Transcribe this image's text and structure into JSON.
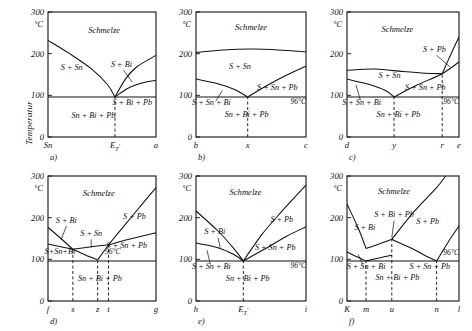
{
  "figure": {
    "y_axis_label": "Temperatur",
    "unit_label": "°C",
    "y_ticks": [
      "300",
      "200",
      "100",
      "0"
    ],
    "eutectic_label": "96°C",
    "melt_label": "Schmelze"
  },
  "chart_data": {
    "type": "line",
    "ylabel": "Temperatur",
    "yunit": "°C",
    "ylim": [
      0,
      300
    ],
    "yticks": [
      0,
      100,
      200,
      300
    ],
    "eutectic_temperature": 96,
    "grid": false,
    "panels": [
      {
        "id": "a",
        "caption": "a)",
        "axis_labels": [
          "Sn",
          "E'_T",
          "a"
        ],
        "axis_label_positions": [
          0.0,
          0.62,
          1.0
        ],
        "dashed_verticals": [
          0.62
        ],
        "regions": [
          {
            "label": "Schmelze",
            "x": 0.52,
            "y": 250
          },
          {
            "label": "S + Sn",
            "x": 0.22,
            "y": 160
          },
          {
            "label": "S + Bi",
            "x": 0.68,
            "y": 168
          },
          {
            "label": "S + Bi + Pb",
            "x": 0.78,
            "y": 78
          },
          {
            "label": "Sn + Bi + Pb",
            "x": 0.42,
            "y": 45
          }
        ],
        "curves": [
          {
            "name": "liquidus-Sn",
            "points": [
              [
                0.0,
                232
              ],
              [
                0.2,
                200
              ],
              [
                0.4,
                164
              ],
              [
                0.55,
                126
              ],
              [
                0.62,
                96
              ]
            ]
          },
          {
            "name": "liquidus-right-upper",
            "points": [
              [
                0.62,
                96
              ],
              [
                0.72,
                140
              ],
              [
                0.82,
                168
              ],
              [
                1.0,
                196
              ]
            ]
          },
          {
            "name": "liquidus-right-lower",
            "points": [
              [
                0.62,
                96
              ],
              [
                0.75,
                118
              ],
              [
                0.88,
                130
              ],
              [
                1.0,
                136
              ]
            ]
          }
        ],
        "eutectic_line_y": 96
      },
      {
        "id": "b",
        "caption": "b)",
        "axis_labels": [
          "b",
          "x",
          "c"
        ],
        "axis_label_positions": [
          0.0,
          0.47,
          1.0
        ],
        "dashed_verticals": [
          0.47
        ],
        "regions": [
          {
            "label": "Schmelze",
            "x": 0.5,
            "y": 258
          },
          {
            "label": "S + Sn",
            "x": 0.4,
            "y": 163
          },
          {
            "label": "S + Sn + Pb",
            "x": 0.74,
            "y": 112
          },
          {
            "label": "S + Sn + Bi",
            "x": 0.14,
            "y": 78
          },
          {
            "label": "Sn + Bi + Pb",
            "x": 0.46,
            "y": 48
          },
          {
            "label": "96°C",
            "x": 0.93,
            "y": 80
          }
        ],
        "curves": [
          {
            "name": "upper-liquidus",
            "points": [
              [
                0.0,
                203
              ],
              [
                0.25,
                209
              ],
              [
                0.5,
                211
              ],
              [
                0.75,
                209
              ],
              [
                1.0,
                204
              ]
            ]
          },
          {
            "name": "solidus-left",
            "points": [
              [
                0.0,
                139
              ],
              [
                0.2,
                128
              ],
              [
                0.35,
                114
              ],
              [
                0.47,
                96
              ]
            ]
          },
          {
            "name": "solidus-right",
            "points": [
              [
                0.47,
                96
              ],
              [
                0.65,
                124
              ],
              [
                0.82,
                148
              ],
              [
                1.0,
                170
              ]
            ]
          }
        ],
        "eutectic_line_y": 96
      },
      {
        "id": "c",
        "caption": "c)",
        "axis_labels": [
          "d",
          "y",
          "r",
          "e"
        ],
        "axis_label_positions": [
          0.0,
          0.42,
          0.85,
          1.0
        ],
        "dashed_verticals": [
          0.42,
          0.85
        ],
        "regions": [
          {
            "label": "Schmelze",
            "x": 0.45,
            "y": 253
          },
          {
            "label": "S + Sn",
            "x": 0.38,
            "y": 142
          },
          {
            "label": "S + Pb",
            "x": 0.78,
            "y": 205
          },
          {
            "label": "S + Sn + Pb",
            "x": 0.7,
            "y": 112
          },
          {
            "label": "S + Sn + Bi",
            "x": 0.13,
            "y": 78
          },
          {
            "label": "Sn + Bi + Pb",
            "x": 0.46,
            "y": 48
          },
          {
            "label": "96°C",
            "x": 0.93,
            "y": 80
          }
        ],
        "curves": [
          {
            "name": "upper-liquidus",
            "points": [
              [
                0.0,
                160
              ],
              [
                0.25,
                163
              ],
              [
                0.5,
                157
              ],
              [
                0.7,
                153
              ],
              [
                0.85,
                152
              ]
            ]
          },
          {
            "name": "upper-liquidus-right",
            "points": [
              [
                0.85,
                152
              ],
              [
                0.93,
                200
              ],
              [
                1.0,
                240
              ]
            ]
          },
          {
            "name": "solidus-left",
            "points": [
              [
                0.0,
                139
              ],
              [
                0.2,
                126
              ],
              [
                0.34,
                112
              ],
              [
                0.42,
                96
              ]
            ]
          },
          {
            "name": "solidus-right",
            "points": [
              [
                0.42,
                96
              ],
              [
                0.62,
                124
              ],
              [
                0.85,
                152
              ],
              [
                1.0,
                180
              ]
            ]
          }
        ],
        "eutectic_line_y": 96
      },
      {
        "id": "d",
        "caption": "d)",
        "axis_labels": [
          "f",
          "s",
          "z",
          "t",
          "g"
        ],
        "axis_label_positions": [
          0.0,
          0.23,
          0.46,
          0.56,
          1.0
        ],
        "dashed_verticals": [
          0.23,
          0.46,
          0.56
        ],
        "regions": [
          {
            "label": "Schmelze",
            "x": 0.47,
            "y": 253
          },
          {
            "label": "S + Bi",
            "x": 0.17,
            "y": 188
          },
          {
            "label": "S + Sn",
            "x": 0.4,
            "y": 155
          },
          {
            "label": "S + Pb",
            "x": 0.8,
            "y": 198
          },
          {
            "label": "S + Sn + Pb",
            "x": 0.73,
            "y": 128
          },
          {
            "label": "S+Sn+Bi",
            "x": 0.11,
            "y": 114
          },
          {
            "label": "Sn + Bi + Pb",
            "x": 0.48,
            "y": 48
          },
          {
            "label": "96°C",
            "x": 0.6,
            "y": 112
          }
        ],
        "curves": [
          {
            "name": "bi-liquidus",
            "points": [
              [
                0.0,
                177
              ],
              [
                0.12,
                150
              ],
              [
                0.23,
                124
              ]
            ]
          },
          {
            "name": "sn-liquidus-down",
            "points": [
              [
                0.23,
                124
              ],
              [
                0.35,
                110
              ],
              [
                0.46,
                99
              ]
            ]
          },
          {
            "name": "sn-liquidus-up",
            "points": [
              [
                0.46,
                99
              ],
              [
                0.52,
                120
              ],
              [
                0.56,
                135
              ]
            ]
          },
          {
            "name": "pb-liquidus",
            "points": [
              [
                0.56,
                135
              ],
              [
                0.72,
                185
              ],
              [
                0.88,
                235
              ],
              [
                1.0,
                272
              ]
            ]
          },
          {
            "name": "lower-left",
            "points": [
              [
                0.0,
                137
              ],
              [
                0.12,
                130
              ],
              [
                0.23,
                124
              ]
            ]
          },
          {
            "name": "lower-mid",
            "points": [
              [
                0.23,
                124
              ],
              [
                0.4,
                130
              ],
              [
                0.56,
                135
              ]
            ]
          },
          {
            "name": "lower-right",
            "points": [
              [
                0.56,
                135
              ],
              [
                0.75,
                148
              ],
              [
                1.0,
                164
              ]
            ]
          }
        ],
        "eutectic_line_y": 96
      },
      {
        "id": "e",
        "caption": "e)",
        "axis_labels": [
          "h",
          "E'_T",
          "i"
        ],
        "axis_label_positions": [
          0.0,
          0.43,
          1.0
        ],
        "dashed_verticals": [
          0.43
        ],
        "regions": [
          {
            "label": "Schmelze",
            "x": 0.45,
            "y": 255
          },
          {
            "label": "S + Bi",
            "x": 0.17,
            "y": 160
          },
          {
            "label": "S + Pb",
            "x": 0.78,
            "y": 190
          },
          {
            "label": "S + Sn + Pb",
            "x": 0.72,
            "y": 122
          },
          {
            "label": "S + Sn + Bi",
            "x": 0.14,
            "y": 78
          },
          {
            "label": "Sn + Bi + Pb",
            "x": 0.47,
            "y": 48
          },
          {
            "label": "96°C",
            "x": 0.93,
            "y": 80
          }
        ],
        "curves": [
          {
            "name": "bi-liquidus",
            "points": [
              [
                0.0,
                216
              ],
              [
                0.2,
                168
              ],
              [
                0.35,
                124
              ],
              [
                0.43,
                96
              ]
            ]
          },
          {
            "name": "pb-liquidus",
            "points": [
              [
                0.43,
                96
              ],
              [
                0.6,
                160
              ],
              [
                0.78,
                215
              ],
              [
                1.0,
                278
              ]
            ]
          },
          {
            "name": "solidus-left",
            "points": [
              [
                0.0,
                139
              ],
              [
                0.2,
                128
              ],
              [
                0.34,
                112
              ],
              [
                0.43,
                96
              ]
            ]
          },
          {
            "name": "solidus-right",
            "points": [
              [
                0.43,
                96
              ],
              [
                0.62,
                124
              ],
              [
                0.82,
                155
              ],
              [
                1.0,
                178
              ]
            ]
          }
        ],
        "eutectic_line_y": 96
      },
      {
        "id": "f",
        "caption": "f)",
        "axis_labels": [
          "K",
          "m",
          "u",
          "n",
          "l"
        ],
        "axis_label_positions": [
          0.0,
          0.17,
          0.4,
          0.8,
          1.0
        ],
        "dashed_verticals": [
          0.17,
          0.4,
          0.8
        ],
        "regions": [
          {
            "label": "Schmelze",
            "x": 0.42,
            "y": 258
          },
          {
            "label": "S + Bi",
            "x": 0.16,
            "y": 170
          },
          {
            "label": "S + Bi + Pb",
            "x": 0.42,
            "y": 202
          },
          {
            "label": "S + Pb",
            "x": 0.72,
            "y": 185
          },
          {
            "label": "S + Sn + Bi",
            "x": 0.17,
            "y": 78
          },
          {
            "label": "S + Sn + Pb",
            "x": 0.74,
            "y": 78
          },
          {
            "label": "Sn + Bi + Pb",
            "x": 0.45,
            "y": 50
          },
          {
            "label": "96°C",
            "x": 0.93,
            "y": 110
          }
        ],
        "curves": [
          {
            "name": "bi-liquidus",
            "points": [
              [
                0.0,
                233
              ],
              [
                0.1,
                175
              ],
              [
                0.17,
                126
              ]
            ]
          },
          {
            "name": "bi-liquidus-to-u",
            "points": [
              [
                0.17,
                126
              ],
              [
                0.28,
                136
              ],
              [
                0.4,
                148
              ]
            ]
          },
          {
            "name": "pb-liquidus-up",
            "points": [
              [
                0.4,
                148
              ],
              [
                0.6,
                215
              ],
              [
                0.8,
                272
              ],
              [
                0.88,
                300
              ]
            ]
          },
          {
            "name": "pb-solidus-down",
            "points": [
              [
                0.4,
                148
              ],
              [
                0.58,
                126
              ],
              [
                0.72,
                106
              ],
              [
                0.8,
                96
              ]
            ]
          },
          {
            "name": "right-liquidus",
            "points": [
              [
                0.8,
                96
              ],
              [
                0.9,
                140
              ],
              [
                1.0,
                180
              ]
            ]
          },
          {
            "name": "left-solidus",
            "points": [
              [
                0.0,
                118
              ],
              [
                0.09,
                106
              ],
              [
                0.17,
                96
              ]
            ]
          },
          {
            "name": "mid-solidus",
            "points": [
              [
                0.17,
                96
              ],
              [
                0.3,
                104
              ],
              [
                0.4,
                110
              ]
            ]
          }
        ],
        "eutectic_line_y": 96
      }
    ]
  }
}
